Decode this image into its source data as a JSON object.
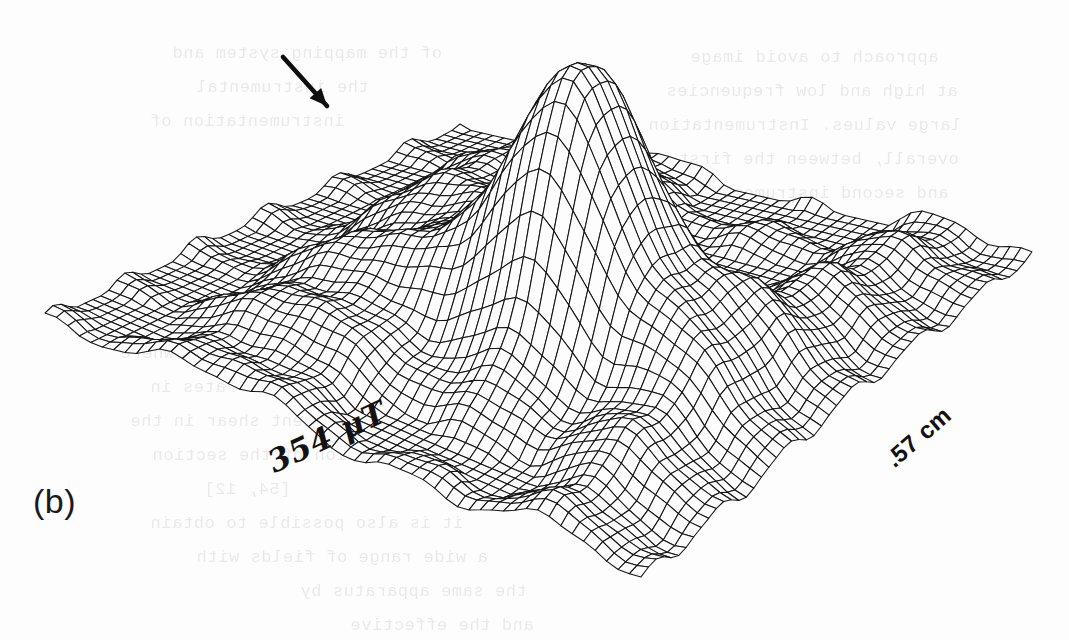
{
  "figure": {
    "panel_label": "(b)",
    "caption_marker": "b",
    "background_color": "#fdfdfd",
    "ink_color": "#141414"
  },
  "annotations": {
    "arrow": {
      "name": "pointer-arrow",
      "description": "solid arrow pointing down-right at the stepped shoulder of the secondary ridge",
      "x1": 283,
      "y1": 57,
      "x2": 327,
      "y2": 106,
      "angle_deg": 48
    },
    "labels": [
      {
        "id": "left-axis",
        "text": "354 μT",
        "value": "354",
        "unit": "μT",
        "rotation_deg": -25,
        "style": "handwritten-italic-serif"
      },
      {
        "id": "right-axis",
        "text": ".57 cm",
        "value": ".57",
        "unit": "cm",
        "rotation_deg": -41,
        "style": "bold-sans"
      }
    ]
  },
  "chart_data": {
    "type": "surface",
    "title": "",
    "subtitle": "",
    "xlabel": ".57 cm",
    "ylabel": "354 μT",
    "zlabel": "",
    "grid": true,
    "legend_position": "none",
    "wireframe": true,
    "hidden_line_removal": true,
    "nx": 52,
    "ny": 52,
    "xlim": [
      0,
      0.57
    ],
    "ylim": [
      0,
      354
    ],
    "zlim": [
      0,
      1
    ],
    "tick_labels": {
      "x": [
        ".57 cm"
      ],
      "y": [
        "354 μT"
      ],
      "z": []
    },
    "projection": {
      "corner_left": [
        45,
        322
      ],
      "corner_back": [
        460,
        128
      ],
      "corner_right": [
        1032,
        258
      ],
      "corner_front": [
        641,
        589
      ],
      "base_plane_height_px": 0,
      "peak_height_px": 300
    },
    "features": [
      {
        "name": "main-peak",
        "kind": "gaussian",
        "u": 0.6,
        "v": 0.44,
        "amplitude": 1.0,
        "sigma_u": 0.115,
        "sigma_v": 0.105,
        "apex_px": [
          543,
          37
        ]
      },
      {
        "name": "secondary-ridge",
        "kind": "ridge",
        "u": 0.3,
        "v": 0.46,
        "amplitude": 0.4,
        "sigma_u": 0.085,
        "sigma_v": 0.3,
        "note": "stepped shoulder indicated by the arrow"
      },
      {
        "name": "right-side-lobe",
        "kind": "ridge",
        "u": 0.86,
        "v": 0.47,
        "amplitude": 0.21,
        "sigma_u": 0.075,
        "sigma_v": 0.33
      },
      {
        "name": "front-ripple-band",
        "kind": "ripple",
        "amplitude": 0.055,
        "wavelength_v": 0.17,
        "note": "low-amplitude periodic corrugation across the baseplane"
      }
    ],
    "values_note": "surface heights are normalised 0-1 of the peak; the vertical axis carries no tick labels in the figure"
  },
  "ghost_text": {
    "note": "faint mirrored show-through from the reverse side of the scanned page",
    "lines": [
      {
        "text": "approach to avoid image",
        "x": 690,
        "y": 48,
        "size": 17
      },
      {
        "text": "at high and low frequencies",
        "x": 666,
        "y": 82,
        "size": 17
      },
      {
        "text": "large values. Instrumentation",
        "x": 648,
        "y": 116,
        "size": 17
      },
      {
        "text": "overall, between the first",
        "x": 678,
        "y": 150,
        "size": 17
      },
      {
        "text": "and second instrumental",
        "x": 700,
        "y": 184,
        "size": 17
      },
      {
        "text": "approaches to chopper",
        "x": 714,
        "y": 218,
        "size": 17
      },
      {
        "text": "performance and resolution",
        "x": 690,
        "y": 252,
        "size": 17
      },
      {
        "text": "of the mapping system and",
        "x": 172,
        "y": 44,
        "size": 17
      },
      {
        "text": "the instrumental",
        "x": 196,
        "y": 78,
        "size": 17
      },
      {
        "text": "instrumentation of",
        "x": 150,
        "y": 112,
        "size": 17
      },
      {
        "text": "in the region where",
        "x": 120,
        "y": 344,
        "size": 17
      },
      {
        "text": "measurement rates in",
        "x": 150,
        "y": 378,
        "size": 17
      },
      {
        "text": "the gradient shear in the",
        "x": 130,
        "y": 412,
        "size": 17
      },
      {
        "text": "resolution of the section",
        "x": 152,
        "y": 446,
        "size": 17
      },
      {
        "text": "[54, 12]",
        "x": 204,
        "y": 480,
        "size": 17
      },
      {
        "text": "it is also possible to obtain",
        "x": 150,
        "y": 514,
        "size": 17
      },
      {
        "text": "a wide range of fields with",
        "x": 196,
        "y": 548,
        "size": 17
      },
      {
        "text": "the same apparatus by",
        "x": 300,
        "y": 582,
        "size": 17
      },
      {
        "text": "and the effective",
        "x": 350,
        "y": 616,
        "size": 17
      }
    ]
  }
}
